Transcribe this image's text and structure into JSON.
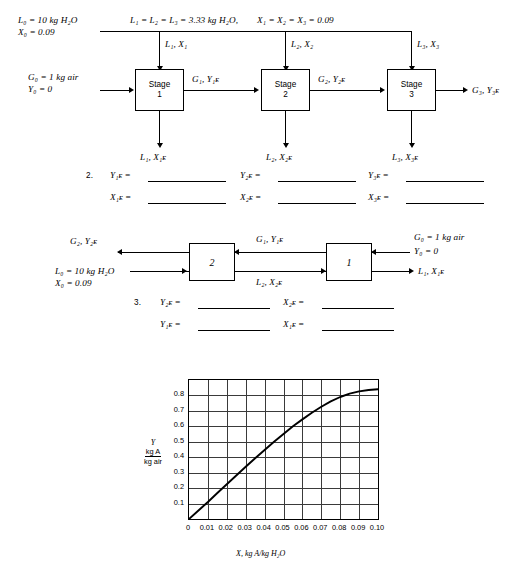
{
  "diagram1": {
    "top_note_left": "L₁ = L₂ = L₃ = 3.33 kg H₂O,",
    "top_note_right": "X₁ = X₂ = X₃ = 0.09",
    "feed_line1": "L₀ = 10 kg H₂O",
    "feed_line2": "X₀ = 0.09",
    "gas_line1": "G₀ = 1 kg air",
    "gas_line2": "Y₀ = 0",
    "down_labels": [
      "L₁, X₁",
      "L₂, X₂",
      "L₃, X₃"
    ],
    "stages": [
      {
        "name": "Stage",
        "number": "1"
      },
      {
        "name": "Stage",
        "number": "2"
      },
      {
        "name": "Stage",
        "number": "3"
      }
    ],
    "between_labels": [
      "G₁, Y₁ᴇ",
      "G₂, Y₂ᴇ"
    ],
    "outlet_label": "G₃, Y₃ᴇ",
    "bottom_labels": [
      "L₁, X₁ᴇ",
      "L₂, X₂ᴇ",
      "L₃, X₃ᴇ"
    ]
  },
  "question2": {
    "number": "2.",
    "rows": [
      [
        "Y₁ᴇ =",
        "Y₂ᴇ =",
        "Y₃ᴇ ="
      ],
      [
        "X₁ᴇ =",
        "X₂ᴇ =",
        "X₃ᴇ ="
      ]
    ]
  },
  "diagram2": {
    "out_gas": "G₂, Y₂ᴇ",
    "feed_line1": "L₀ = 10 kg H₂O",
    "feed_line2": "X₀ = 0.09",
    "mid_top": "G₁, Y₁ᴇ",
    "mid_bottom": "L₂, X₂ᴇ",
    "in_gas_line1": "G₀ = 1 kg air",
    "in_gas_line2": "Y₀ = 0",
    "out_liquid": "L₁, X₁ᴇ",
    "boxes": [
      "2",
      "1"
    ]
  },
  "question3": {
    "number": "3.",
    "rows": [
      [
        "Y₂ᴇ =",
        "X₂ᴇ ="
      ],
      [
        "Y₁ᴇ =",
        "X₁ᴇ ="
      ]
    ]
  },
  "chart_data": {
    "type": "line",
    "title": "",
    "xlabel": "X, kg A/kg H₂O",
    "ylabel_parts": {
      "symbol": "Y",
      "numerator": "kg A",
      "denominator": "kg air"
    },
    "xlim": [
      0,
      0.1
    ],
    "ylim": [
      0,
      0.9
    ],
    "xticks": [
      0,
      0.01,
      0.02,
      0.03,
      0.04,
      0.05,
      0.06,
      0.07,
      0.08,
      0.09,
      0.1
    ],
    "xticklabels": [
      "0",
      "0.01",
      "0.02",
      "0.03",
      "0.04",
      "0.05",
      "0.06",
      "0.07",
      "0.08",
      "0.09",
      "0.10"
    ],
    "yticks": [
      0.1,
      0.2,
      0.3,
      0.4,
      0.5,
      0.6,
      0.7,
      0.8
    ],
    "yticklabels": [
      "0.1",
      "0.2",
      "0.3",
      "0.4",
      "0.5",
      "0.6",
      "0.7",
      "0.8"
    ],
    "grid": true,
    "legend": "none",
    "series": [
      {
        "name": "equilibrium curve",
        "x": [
          0,
          0.005,
          0.01,
          0.015,
          0.02,
          0.025,
          0.03,
          0.035,
          0.04,
          0.045,
          0.05,
          0.055,
          0.06,
          0.065,
          0.07,
          0.075,
          0.08,
          0.085,
          0.09,
          0.095,
          0.1
        ],
        "y": [
          0.0,
          0.055,
          0.11,
          0.168,
          0.225,
          0.282,
          0.338,
          0.393,
          0.447,
          0.5,
          0.551,
          0.6,
          0.645,
          0.688,
          0.727,
          0.762,
          0.79,
          0.812,
          0.826,
          0.835,
          0.84
        ]
      }
    ]
  }
}
